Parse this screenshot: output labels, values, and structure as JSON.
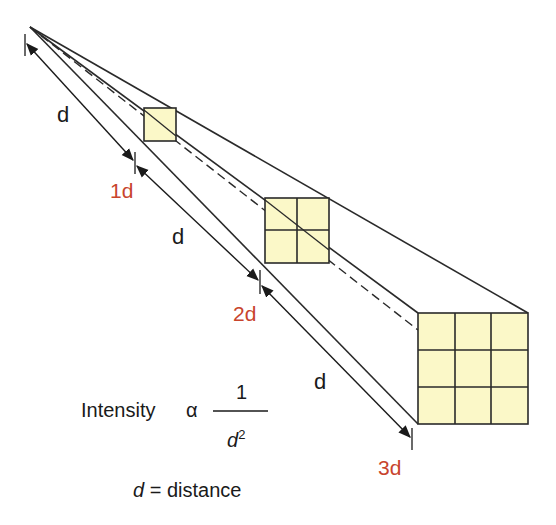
{
  "diagram": {
    "colors": {
      "line": "#2a2a2a",
      "box_fill": "#fbf8c8",
      "box_stroke": "#2a2a2a",
      "marker_text": "#c8442c",
      "text": "#1a1a1a"
    },
    "segment_labels": [
      "d",
      "d",
      "d"
    ],
    "distance_markers": [
      "1d",
      "2d",
      "3d"
    ],
    "boxes": [
      {
        "grid": "1x1",
        "cells": 1
      },
      {
        "grid": "2x2",
        "cells": 4
      },
      {
        "grid": "3x3",
        "cells": 9
      }
    ],
    "formula": {
      "lhs": "Intensity",
      "relation": "α",
      "numerator": "1",
      "denominator_var": "d",
      "denominator_exp": "2"
    },
    "legend": {
      "var": "d",
      "equals": "=",
      "meaning": "distance"
    }
  }
}
